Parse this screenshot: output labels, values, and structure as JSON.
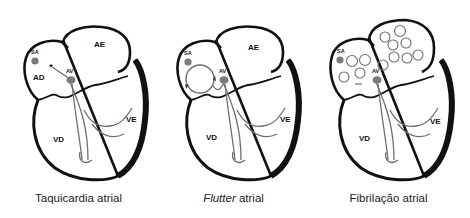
{
  "figure": {
    "panels": [
      {
        "id": "taquicardia",
        "caption_italic": "",
        "caption_rest": "Taquicardia atrial",
        "labels": {
          "sa": "SA",
          "av": "AV",
          "ad": "AD",
          "ae": "AE",
          "vd": "VD",
          "ve": "VE"
        },
        "marker": "*"
      },
      {
        "id": "flutter",
        "caption_italic": "Flutter",
        "caption_rest": " atrial",
        "labels": {
          "sa": "SA",
          "av": "AV",
          "ae": "AE",
          "vd": "VD",
          "ve": "VE"
        }
      },
      {
        "id": "fibrilacao",
        "caption_italic": "",
        "caption_rest": "Fibrilação atrial",
        "labels": {
          "sa": "SA",
          "av": "AV",
          "vd": "VD",
          "ve": "VE"
        }
      }
    ],
    "colors": {
      "outline": "#111111",
      "node": "#7a7a7a",
      "conduction": "#6e6e6e"
    }
  }
}
